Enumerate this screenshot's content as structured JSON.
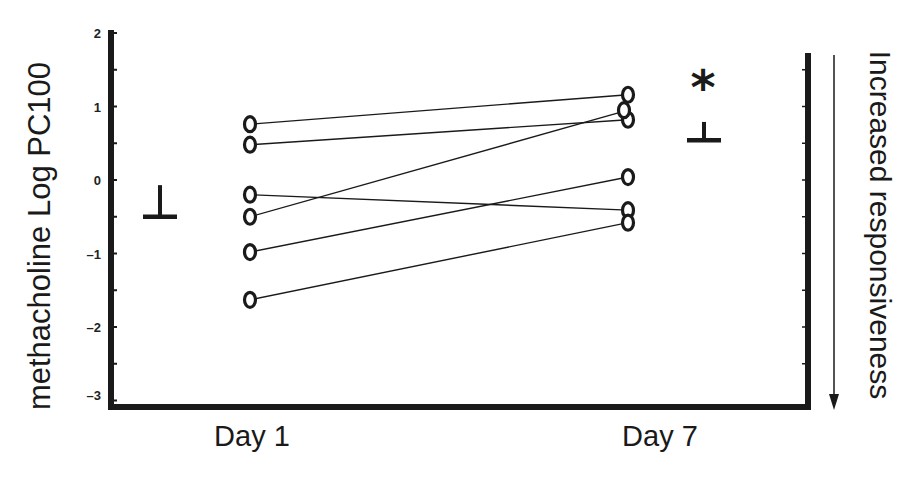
{
  "chart_data": {
    "type": "line",
    "title": "",
    "xlabel": "",
    "ylabel": "methacholine Log PC100",
    "right_label": "Increased responsiveness",
    "right_arrow": "down",
    "categories": [
      "Day 1",
      "Day 7"
    ],
    "ylim": [
      -3,
      2
    ],
    "yticks": [
      "2",
      "1",
      "0",
      "-1",
      "-2",
      "-3"
    ],
    "grid": false,
    "legend": null,
    "series": [
      {
        "name": "Subject 1",
        "values": [
          0.76,
          1.16
        ]
      },
      {
        "name": "Subject 2",
        "values": [
          0.48,
          0.82
        ]
      },
      {
        "name": "Subject 3",
        "values": [
          -0.2,
          -0.41
        ]
      },
      {
        "name": "Subject 4",
        "values": [
          -0.5,
          0.95
        ]
      },
      {
        "name": "Subject 5",
        "values": [
          -0.98,
          0.04
        ]
      },
      {
        "name": "Subject 6",
        "values": [
          -1.63,
          -0.58
        ]
      }
    ],
    "group_means": [
      {
        "category": "Day 1",
        "mean": -0.5,
        "upper_error": -0.07
      },
      {
        "category": "Day 7",
        "mean": 0.54,
        "upper_error": 0.79
      }
    ],
    "annotations": [
      {
        "text": "*",
        "category": "Day 7",
        "meaning": "significant difference"
      }
    ]
  },
  "labels": {
    "ylabel": "methacholine Log PC100",
    "right_label": "Increased responsiveness",
    "x": [
      "Day 1",
      "Day 7"
    ],
    "y": [
      "2",
      "1",
      "0",
      "-1",
      "-2",
      "-3"
    ],
    "asterisk": "*"
  },
  "colors": {
    "ink": "#1a1a1a",
    "background": "#ffffff"
  }
}
